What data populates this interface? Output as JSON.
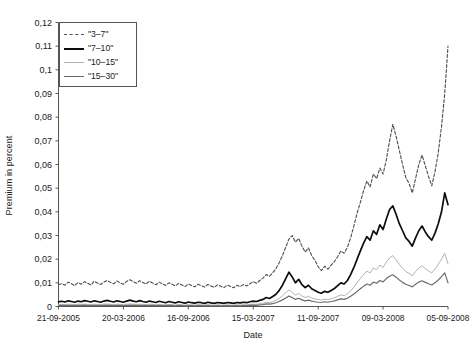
{
  "chart_data": {
    "type": "line",
    "title": "",
    "xlabel": "Date",
    "ylabel": "Premium in percent",
    "ylim": [
      0,
      0.12
    ],
    "grid": false,
    "legend_position": "top-left",
    "ytick_labels": [
      "0,12",
      "0,11",
      "0,1",
      "0,09",
      "0,08",
      "0,07",
      "0,06",
      "0,05",
      "0,04",
      "0,03",
      "0,02",
      "0,01",
      "0"
    ],
    "ytick_values": [
      0.12,
      0.11,
      0.1,
      0.09,
      0.08,
      0.07,
      0.06,
      0.05,
      0.04,
      0.03,
      0.02,
      0.01,
      0
    ],
    "xtick_labels": [
      "21-09-2005",
      "20-03-2006",
      "16-09-2006",
      "15-03-2007",
      "11-09-2007",
      "09-03-2008",
      "05-09-2008"
    ],
    "xtick_positions": [
      0,
      0.1667,
      0.3333,
      0.5,
      0.6667,
      0.8333,
      1.0
    ],
    "x_index_range": [
      0,
      120
    ],
    "series": [
      {
        "name": "\"3–7\"",
        "color": "#4d4d4d",
        "style": "dashed",
        "width": 1.1,
        "values": [
          0.0092,
          0.0097,
          0.009,
          0.0103,
          0.0096,
          0.0088,
          0.0101,
          0.0094,
          0.0105,
          0.0098,
          0.0091,
          0.0107,
          0.0099,
          0.0093,
          0.0104,
          0.011,
          0.0102,
          0.0096,
          0.0108,
          0.01,
          0.0094,
          0.0106,
          0.0113,
          0.0105,
          0.0098,
          0.0109,
          0.0101,
          0.0095,
          0.0107,
          0.0099,
          0.0092,
          0.0103,
          0.0096,
          0.0089,
          0.01,
          0.0094,
          0.0087,
          0.0098,
          0.0091,
          0.0084,
          0.0095,
          0.0089,
          0.0083,
          0.0094,
          0.0088,
          0.0082,
          0.0093,
          0.0087,
          0.0081,
          0.0092,
          0.0086,
          0.008,
          0.0091,
          0.0085,
          0.0079,
          0.009,
          0.0084,
          0.0093,
          0.0087,
          0.0096,
          0.0105,
          0.0098,
          0.011,
          0.012,
          0.0135,
          0.0128,
          0.0142,
          0.016,
          0.0185,
          0.0215,
          0.025,
          0.0285,
          0.03,
          0.0272,
          0.0288,
          0.0255,
          0.023,
          0.0248,
          0.0215,
          0.0195,
          0.0168,
          0.0152,
          0.017,
          0.0158,
          0.0175,
          0.019,
          0.021,
          0.0235,
          0.0225,
          0.025,
          0.029,
          0.034,
          0.0395,
          0.044,
          0.049,
          0.053,
          0.0505,
          0.056,
          0.054,
          0.0585,
          0.056,
          0.062,
          0.07,
          0.077,
          0.072,
          0.066,
          0.06,
          0.0545,
          0.052,
          0.048,
          0.054,
          0.06,
          0.064,
          0.0595,
          0.055,
          0.051,
          0.057,
          0.065,
          0.076,
          0.09,
          0.11
        ]
      },
      {
        "name": "\"7–10\"",
        "color": "#0d0d0d",
        "style": "solid",
        "width": 1.7,
        "values": [
          0.002,
          0.0022,
          0.0019,
          0.0024,
          0.0021,
          0.0018,
          0.0023,
          0.002,
          0.0025,
          0.0022,
          0.0019,
          0.0024,
          0.0021,
          0.0018,
          0.0023,
          0.0026,
          0.0022,
          0.0019,
          0.0024,
          0.0021,
          0.0018,
          0.0023,
          0.0027,
          0.0023,
          0.002,
          0.0025,
          0.0021,
          0.0018,
          0.0023,
          0.002,
          0.0017,
          0.0022,
          0.0019,
          0.0016,
          0.0021,
          0.0018,
          0.0015,
          0.002,
          0.0017,
          0.0014,
          0.0019,
          0.0016,
          0.0014,
          0.0018,
          0.0016,
          0.0013,
          0.0018,
          0.0015,
          0.0013,
          0.0017,
          0.0015,
          0.0013,
          0.0017,
          0.0015,
          0.0013,
          0.0017,
          0.0015,
          0.0018,
          0.0016,
          0.002,
          0.0023,
          0.0021,
          0.0026,
          0.003,
          0.0038,
          0.0034,
          0.0042,
          0.0052,
          0.0068,
          0.009,
          0.0118,
          0.0145,
          0.0125,
          0.01,
          0.0115,
          0.0092,
          0.008,
          0.009,
          0.0075,
          0.0068,
          0.006,
          0.0056,
          0.0064,
          0.006,
          0.0068,
          0.0076,
          0.0088,
          0.01,
          0.0095,
          0.011,
          0.0135,
          0.0165,
          0.02,
          0.0235,
          0.0268,
          0.0295,
          0.028,
          0.032,
          0.0305,
          0.0345,
          0.0325,
          0.037,
          0.041,
          0.0425,
          0.039,
          0.035,
          0.032,
          0.029,
          0.0275,
          0.0255,
          0.029,
          0.032,
          0.034,
          0.0315,
          0.0295,
          0.028,
          0.031,
          0.035,
          0.04,
          0.048,
          0.043
        ]
      },
      {
        "name": "\"10–15\"",
        "color": "#b3b3b3",
        "style": "solid",
        "width": 1.0,
        "values": [
          0.0008,
          0.0009,
          0.0008,
          0.001,
          0.0009,
          0.0008,
          0.001,
          0.0009,
          0.001,
          0.0009,
          0.0008,
          0.001,
          0.0009,
          0.0008,
          0.001,
          0.0011,
          0.0009,
          0.0008,
          0.001,
          0.0009,
          0.0008,
          0.001,
          0.0011,
          0.001,
          0.0009,
          0.001,
          0.0009,
          0.0008,
          0.001,
          0.0009,
          0.0007,
          0.0009,
          0.0008,
          0.0007,
          0.0009,
          0.0008,
          0.0006,
          0.0009,
          0.0007,
          0.0006,
          0.0008,
          0.0007,
          0.0006,
          0.0008,
          0.0007,
          0.0006,
          0.0008,
          0.0006,
          0.0005,
          0.0007,
          0.0006,
          0.0005,
          0.0007,
          0.0006,
          0.0005,
          0.0007,
          0.0006,
          0.0008,
          0.0007,
          0.0009,
          0.001,
          0.0009,
          0.0012,
          0.0014,
          0.0018,
          0.0016,
          0.002,
          0.0026,
          0.0034,
          0.0045,
          0.0058,
          0.007,
          0.006,
          0.0048,
          0.0055,
          0.0044,
          0.0038,
          0.0043,
          0.0036,
          0.0032,
          0.0029,
          0.0027,
          0.0031,
          0.0029,
          0.0033,
          0.0037,
          0.0043,
          0.0049,
          0.0046,
          0.0054,
          0.0066,
          0.0082,
          0.01,
          0.0118,
          0.0135,
          0.015,
          0.0142,
          0.0163,
          0.0155,
          0.0175,
          0.0165,
          0.0188,
          0.0205,
          0.0215,
          0.0198,
          0.0178,
          0.0162,
          0.0148,
          0.014,
          0.013,
          0.0148,
          0.0163,
          0.0172,
          0.016,
          0.015,
          0.0142,
          0.0158,
          0.0178,
          0.02,
          0.0225,
          0.018
        ]
      },
      {
        "name": "\"15–30\"",
        "color": "#6b6b6b",
        "style": "solid",
        "width": 1.2,
        "values": [
          0.0004,
          0.0005,
          0.0004,
          0.0005,
          0.0005,
          0.0004,
          0.0005,
          0.0005,
          0.0006,
          0.0005,
          0.0004,
          0.0005,
          0.0005,
          0.0004,
          0.0005,
          0.0006,
          0.0005,
          0.0004,
          0.0005,
          0.0005,
          0.0004,
          0.0005,
          0.0006,
          0.0005,
          0.0005,
          0.0005,
          0.0005,
          0.0004,
          0.0005,
          0.0005,
          0.0004,
          0.0005,
          0.0004,
          0.0004,
          0.0005,
          0.0004,
          0.0003,
          0.0005,
          0.0004,
          0.0003,
          0.0004,
          0.0004,
          0.0003,
          0.0004,
          0.0004,
          0.0003,
          0.0004,
          0.0003,
          0.0003,
          0.0004,
          0.0003,
          0.0003,
          0.0004,
          0.0003,
          0.0003,
          0.0004,
          0.0003,
          0.0004,
          0.0004,
          0.0005,
          0.0006,
          0.0005,
          0.0007,
          0.0008,
          0.0011,
          0.001,
          0.0012,
          0.0016,
          0.0021,
          0.0028,
          0.0036,
          0.0044,
          0.0038,
          0.003,
          0.0035,
          0.0028,
          0.0024,
          0.0027,
          0.0023,
          0.002,
          0.0018,
          0.0017,
          0.002,
          0.0018,
          0.0021,
          0.0024,
          0.0028,
          0.0032,
          0.003,
          0.0035,
          0.0043,
          0.0053,
          0.0064,
          0.0075,
          0.0086,
          0.0095,
          0.009,
          0.0103,
          0.0098,
          0.011,
          0.0104,
          0.0118,
          0.0128,
          0.0134,
          0.0124,
          0.0112,
          0.0102,
          0.0094,
          0.0089,
          0.0083,
          0.0094,
          0.0103,
          0.0109,
          0.0102,
          0.0096,
          0.0091,
          0.01,
          0.0112,
          0.0126,
          0.0142,
          0.01
        ]
      }
    ]
  },
  "legend": {
    "items": [
      {
        "label": "\"3–7\""
      },
      {
        "label": "\"7–10\""
      },
      {
        "label": "\"10–15\""
      },
      {
        "label": "\"15–30\""
      }
    ]
  }
}
